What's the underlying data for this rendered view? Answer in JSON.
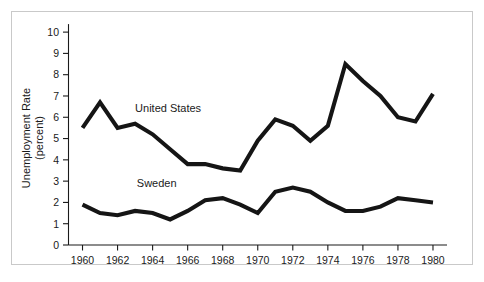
{
  "chart_data": {
    "type": "line",
    "title": "",
    "xlabel": "",
    "ylabel": "Unemployment Rate\n(percent)",
    "ylabel_line1": "Unemployment Rate",
    "ylabel_line2": "(percent)",
    "xlim": [
      1959.2,
      1980.8
    ],
    "ylim": [
      0,
      10.4
    ],
    "grid": false,
    "legend_position": "inline-annotation",
    "x": [
      1960,
      1961,
      1962,
      1963,
      1964,
      1965,
      1966,
      1967,
      1968,
      1969,
      1970,
      1971,
      1972,
      1973,
      1974,
      1975,
      1976,
      1977,
      1978,
      1979,
      1980
    ],
    "xticks": [
      1960,
      1962,
      1964,
      1966,
      1968,
      1970,
      1972,
      1974,
      1976,
      1978,
      1980
    ],
    "xtick_labels": [
      "1960",
      "1962",
      "1964",
      "1966",
      "1968",
      "1970",
      "1972",
      "1974",
      "1976",
      "1978",
      "1980"
    ],
    "yticks": [
      0,
      1,
      2,
      3,
      4,
      5,
      6,
      7,
      8,
      9,
      10
    ],
    "ytick_labels": [
      "0",
      "1",
      "2",
      "3",
      "4",
      "5",
      "6",
      "7",
      "8",
      "9",
      "10"
    ],
    "series": [
      {
        "name": "United States",
        "label": "United States",
        "color": "#151515",
        "label_x": 1963.0,
        "label_y": 6.25,
        "values": [
          5.5,
          6.7,
          5.5,
          5.7,
          5.2,
          4.5,
          3.8,
          3.8,
          3.6,
          3.5,
          4.9,
          5.9,
          5.6,
          4.9,
          5.6,
          8.5,
          7.7,
          7.0,
          6.0,
          5.8,
          7.1
        ]
      },
      {
        "name": "Sweden",
        "label": "Sweden",
        "color": "#151515",
        "label_x": 1963.1,
        "label_y": 2.72,
        "values": [
          1.9,
          1.5,
          1.4,
          1.6,
          1.5,
          1.2,
          1.6,
          2.1,
          2.2,
          1.9,
          1.5,
          2.5,
          2.7,
          2.5,
          2.0,
          1.6,
          1.6,
          1.8,
          2.2,
          2.1,
          2.0
        ]
      }
    ],
    "colors": {
      "line": "#151515",
      "axis": "#1a1a1a",
      "frame": "#c9c9c9",
      "background": "#ffffff"
    }
  }
}
